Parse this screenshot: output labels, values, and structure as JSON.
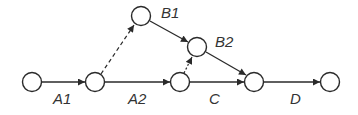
{
  "diagram": {
    "type": "activity-network",
    "nodes": [
      {
        "id": "n0",
        "x": 32,
        "y": 82
      },
      {
        "id": "n1",
        "x": 95,
        "y": 82
      },
      {
        "id": "n2",
        "x": 141,
        "y": 16
      },
      {
        "id": "n3",
        "x": 180,
        "y": 82
      },
      {
        "id": "n4",
        "x": 197,
        "y": 47
      },
      {
        "id": "n5",
        "x": 254,
        "y": 82
      },
      {
        "id": "n6",
        "x": 330,
        "y": 82
      }
    ],
    "edges": [
      {
        "from": "n0",
        "to": "n1",
        "label": "A1",
        "style": "solid"
      },
      {
        "from": "n1",
        "to": "n2",
        "label": "",
        "style": "dashed"
      },
      {
        "from": "n1",
        "to": "n3",
        "label": "A2",
        "style": "solid"
      },
      {
        "from": "n2",
        "to": "n4",
        "label": "B1",
        "style": "solid"
      },
      {
        "from": "n3",
        "to": "n4",
        "label": "",
        "style": "dashed"
      },
      {
        "from": "n3",
        "to": "n5",
        "label": "C",
        "style": "solid"
      },
      {
        "from": "n4",
        "to": "n5",
        "label": "B2",
        "style": "solid"
      },
      {
        "from": "n5",
        "to": "n6",
        "label": "D",
        "style": "solid"
      }
    ]
  },
  "labels": {
    "a1": "A1",
    "a2": "A2",
    "b1": "B1",
    "b2": "B2",
    "c": "C",
    "d": "D"
  },
  "colors": {
    "stroke": "#2a2a2a",
    "background": "#ffffff"
  }
}
